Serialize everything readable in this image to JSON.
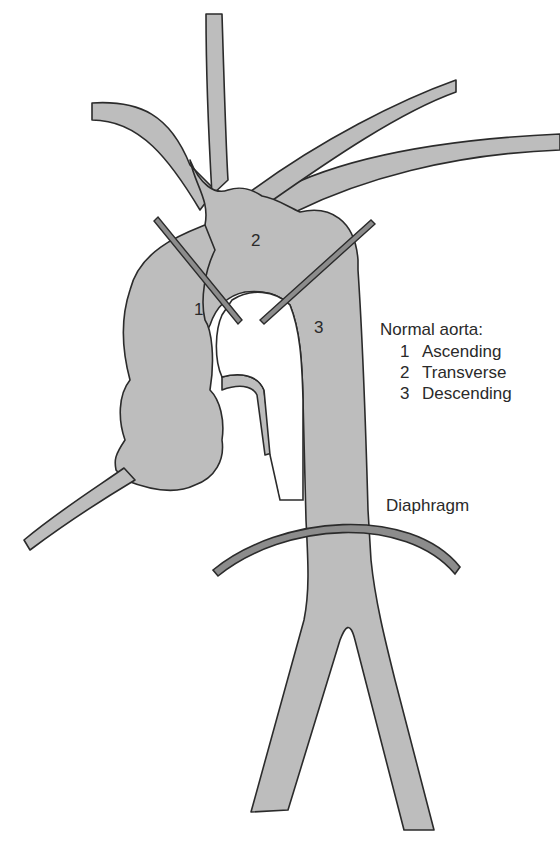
{
  "diagram": {
    "title": "Normal aorta:",
    "segments": [
      {
        "number": "1",
        "name": "Ascending"
      },
      {
        "number": "2",
        "name": "Transverse"
      },
      {
        "number": "3",
        "name": "Descending"
      }
    ],
    "labels": {
      "diaphragm": "Diaphragm"
    },
    "colors": {
      "vessel_fill": "#bdbdbd",
      "outline": "#2b2b2b",
      "marker_fill": "#8c8c8c"
    }
  }
}
